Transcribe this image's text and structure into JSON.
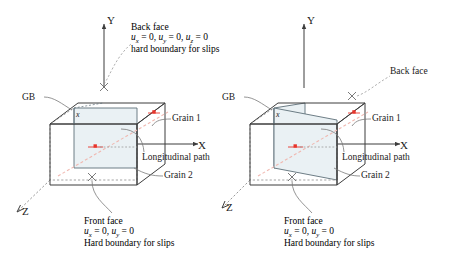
{
  "figure": {
    "type": "schematic-diagram",
    "colors": {
      "line": "#3d3d3d",
      "face_fill": "#eaf1f4",
      "marker": "#e8342a",
      "path": "#f0b8b0",
      "leader": "#7a7a7a",
      "text": "#1a1a1a"
    }
  },
  "panels": [
    {
      "id": "left-panel",
      "gb_type": "vertical",
      "axes": {
        "y": "Y",
        "x": "X",
        "z": "Z"
      },
      "labels": {
        "gb": "GB",
        "gb_mark": "x",
        "grain1": "Grain 1",
        "grain2": "Grain 2",
        "longitudinal_path": "Longitudinal path"
      },
      "back_face": {
        "title": "Back face",
        "constraints": [
          {
            "var": "u",
            "sub": "x",
            "value": "0"
          },
          {
            "var": "u",
            "sub": "y",
            "value": "0"
          },
          {
            "var": "u",
            "sub": "z",
            "value": "0"
          }
        ],
        "note": "hard boundary for slips"
      },
      "front_face": {
        "title": "Front face",
        "constraints": [
          {
            "var": "u",
            "sub": "x",
            "value": "0"
          },
          {
            "var": "u",
            "sub": "y",
            "value": "0"
          }
        ],
        "note": "Hard boundary for slips"
      }
    },
    {
      "id": "right-panel",
      "gb_type": "inclined",
      "axes": {
        "y": "Y",
        "x": "X",
        "z": "Z"
      },
      "labels": {
        "gb": "GB",
        "gb_mark": "x",
        "grain1": "Grain 1",
        "grain2": "Grain 2",
        "longitudinal_path": "Longitudinal path"
      },
      "back_face": {
        "title": "Back face",
        "constraints": [],
        "note": ""
      },
      "front_face": {
        "title": "Front face",
        "constraints": [
          {
            "var": "u",
            "sub": "x",
            "value": "0"
          },
          {
            "var": "u",
            "sub": "y",
            "value": "0"
          }
        ],
        "note": "Hard boundary for slips"
      }
    }
  ],
  "text": {
    "axis_y": "Y",
    "axis_x": "X",
    "axis_z": "Z",
    "gb": "GB",
    "gb_mark": "x",
    "grain1": "Grain 1",
    "grain2": "Grain 2",
    "longitudinal_path": "Longitudinal path",
    "back_face": "Back face",
    "front_face": "Front face",
    "back_note": "hard boundary for slips",
    "front_note": "Hard boundary for slips"
  }
}
